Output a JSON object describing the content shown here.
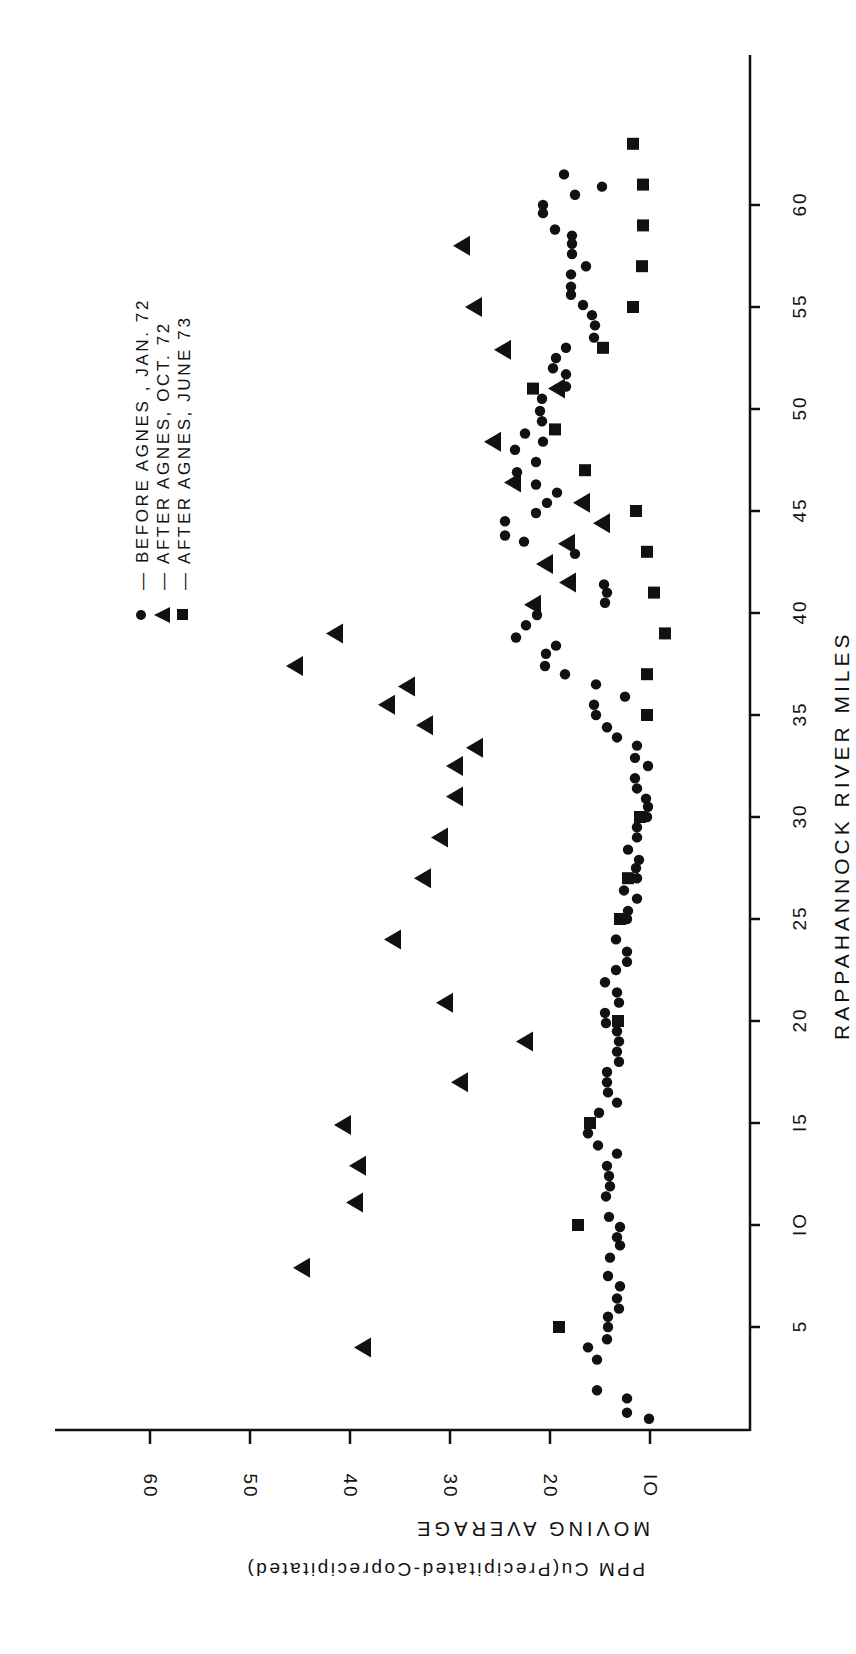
{
  "chart_data": {
    "type": "scatter",
    "orientation_note_visible": "figure rotated 90 degrees counter-clockwise",
    "title": "",
    "xlabel": "RAPPAHANNOCK RIVER MILES",
    "ylabel_line1": "PPM  Cu(Precipitated-Coprecipitated)",
    "ylabel_line2": "MOVING  AVERAGE",
    "xlim": [
      0,
      66
    ],
    "ylim": [
      0,
      70
    ],
    "xticks": [
      5,
      10,
      15,
      20,
      25,
      30,
      35,
      40,
      45,
      50,
      55,
      60
    ],
    "yticks": [
      10,
      20,
      30,
      40,
      50,
      60
    ],
    "grid": false,
    "legend_position": "upper-left of plot (rotated)",
    "series": [
      {
        "name": "BEFORE AGNES, JAN. 72",
        "legend_text": "— BEFORE  AGNES , JAN. 72",
        "marker": "circle",
        "points": [
          [
            0.5,
            10.1
          ],
          [
            0.8,
            12.3
          ],
          [
            1.5,
            12.3
          ],
          [
            1.9,
            15.3
          ],
          [
            3.4,
            15.3
          ],
          [
            4.0,
            16.2
          ],
          [
            4.4,
            14.3
          ],
          [
            5.0,
            14.2
          ],
          [
            5.5,
            14.2
          ],
          [
            5.9,
            13.1
          ],
          [
            6.4,
            13.3
          ],
          [
            7.0,
            13.0
          ],
          [
            7.5,
            14.2
          ],
          [
            8.4,
            14.0
          ],
          [
            9.0,
            13.0
          ],
          [
            9.4,
            13.3
          ],
          [
            9.9,
            13.0
          ],
          [
            10.4,
            14.1
          ],
          [
            11.4,
            14.4
          ],
          [
            11.9,
            14.0
          ],
          [
            12.4,
            14.1
          ],
          [
            12.9,
            14.3
          ],
          [
            13.5,
            13.3
          ],
          [
            13.9,
            15.2
          ],
          [
            14.5,
            16.2
          ],
          [
            15.5,
            15.1
          ],
          [
            16.0,
            13.3
          ],
          [
            16.5,
            14.2
          ],
          [
            17.0,
            14.3
          ],
          [
            17.5,
            14.3
          ],
          [
            18.0,
            13.1
          ],
          [
            18.5,
            13.3
          ],
          [
            19.0,
            13.1
          ],
          [
            19.5,
            13.3
          ],
          [
            19.9,
            14.4
          ],
          [
            20.4,
            14.5
          ],
          [
            20.9,
            13.1
          ],
          [
            21.4,
            13.3
          ],
          [
            21.9,
            14.5
          ],
          [
            22.5,
            13.4
          ],
          [
            22.9,
            12.3
          ],
          [
            23.4,
            12.3
          ],
          [
            24.0,
            13.4
          ],
          [
            25.0,
            12.3
          ],
          [
            25.4,
            12.2
          ],
          [
            26.0,
            11.3
          ],
          [
            26.4,
            12.6
          ],
          [
            27.0,
            11.3
          ],
          [
            27.5,
            11.4
          ],
          [
            27.9,
            11.1
          ],
          [
            28.4,
            12.2
          ],
          [
            29.0,
            11.3
          ],
          [
            29.5,
            11.3
          ],
          [
            30.0,
            10.3
          ],
          [
            30.5,
            10.2
          ],
          [
            30.9,
            10.4
          ],
          [
            31.4,
            11.3
          ],
          [
            31.9,
            11.5
          ],
          [
            32.5,
            10.2
          ],
          [
            32.9,
            11.5
          ],
          [
            33.5,
            11.3
          ],
          [
            33.9,
            13.3
          ],
          [
            34.4,
            14.3
          ],
          [
            35.0,
            15.4
          ],
          [
            35.5,
            15.6
          ],
          [
            35.9,
            12.5
          ],
          [
            36.5,
            15.4
          ],
          [
            37.0,
            18.5
          ],
          [
            37.4,
            20.5
          ],
          [
            38.0,
            20.4
          ],
          [
            38.4,
            19.4
          ],
          [
            38.8,
            23.4
          ],
          [
            39.4,
            22.4
          ],
          [
            39.9,
            21.3
          ],
          [
            40.5,
            14.5
          ],
          [
            41.0,
            14.3
          ],
          [
            41.4,
            14.6
          ],
          [
            42.9,
            17.5
          ],
          [
            43.5,
            22.6
          ],
          [
            43.8,
            24.5
          ],
          [
            44.5,
            24.5
          ],
          [
            44.9,
            21.4
          ],
          [
            45.4,
            20.3
          ],
          [
            45.9,
            19.3
          ],
          [
            46.3,
            21.4
          ],
          [
            46.9,
            23.3
          ],
          [
            47.4,
            21.4
          ],
          [
            48.0,
            23.5
          ],
          [
            48.4,
            20.7
          ],
          [
            48.8,
            22.5
          ],
          [
            49.4,
            20.8
          ],
          [
            49.9,
            21.0
          ],
          [
            50.5,
            20.8
          ],
          [
            51.1,
            18.4
          ],
          [
            51.7,
            18.4
          ],
          [
            52.0,
            19.7
          ],
          [
            52.5,
            19.4
          ],
          [
            53.0,
            18.4
          ],
          [
            53.5,
            15.6
          ],
          [
            54.1,
            15.5
          ],
          [
            54.6,
            15.8
          ],
          [
            55.1,
            16.7
          ],
          [
            55.6,
            17.9
          ],
          [
            56.0,
            17.9
          ],
          [
            56.6,
            17.9
          ],
          [
            57.0,
            16.4
          ],
          [
            57.6,
            17.8
          ],
          [
            58.1,
            17.8
          ],
          [
            58.5,
            17.8
          ],
          [
            58.8,
            19.5
          ],
          [
            59.6,
            20.7
          ],
          [
            60.0,
            20.7
          ],
          [
            60.5,
            17.5
          ],
          [
            60.9,
            14.8
          ],
          [
            61.5,
            18.6
          ]
        ]
      },
      {
        "name": "AFTER AGNES, OCT. 72",
        "legend_text": "— AFTER  AGNES, OCT. 72",
        "marker": "triangle",
        "points": [
          [
            4.0,
            38.7
          ],
          [
            7.9,
            44.8
          ],
          [
            11.1,
            39.5
          ],
          [
            12.9,
            39.2
          ],
          [
            14.9,
            40.7
          ],
          [
            17.0,
            29.0
          ],
          [
            19.0,
            22.5
          ],
          [
            20.9,
            30.5
          ],
          [
            24.0,
            35.7
          ],
          [
            27.0,
            32.7
          ],
          [
            29.0,
            31.0
          ],
          [
            31.0,
            29.5
          ],
          [
            32.5,
            29.5
          ],
          [
            33.4,
            27.5
          ],
          [
            34.5,
            32.5
          ],
          [
            35.5,
            36.3
          ],
          [
            36.4,
            34.3
          ],
          [
            37.4,
            45.5
          ],
          [
            39.0,
            41.5
          ],
          [
            40.4,
            21.7
          ],
          [
            41.5,
            18.2
          ],
          [
            42.4,
            20.5
          ],
          [
            43.4,
            18.3
          ],
          [
            44.4,
            14.8
          ],
          [
            45.4,
            16.8
          ],
          [
            46.4,
            23.7
          ],
          [
            48.4,
            25.7
          ],
          [
            51.0,
            19.3
          ],
          [
            52.9,
            24.7
          ],
          [
            55.0,
            27.6
          ],
          [
            58.0,
            28.8
          ]
        ]
      },
      {
        "name": "AFTER AGNES, JUNE 73",
        "legend_text": "— AFTER  AGNES, JUNE 73",
        "marker": "square",
        "points": [
          [
            5.0,
            19.1
          ],
          [
            10.0,
            17.2
          ],
          [
            15.0,
            16.0
          ],
          [
            20.0,
            13.2
          ],
          [
            25.0,
            13.0
          ],
          [
            27.0,
            12.2
          ],
          [
            30.0,
            11.0
          ],
          [
            35.0,
            10.3
          ],
          [
            37.0,
            10.3
          ],
          [
            39.0,
            8.5
          ],
          [
            41.0,
            9.6
          ],
          [
            43.0,
            10.3
          ],
          [
            45.0,
            11.4
          ],
          [
            47.0,
            16.5
          ],
          [
            49.0,
            19.5
          ],
          [
            51.0,
            21.7
          ],
          [
            53.0,
            14.7
          ],
          [
            55.0,
            11.7
          ],
          [
            57.0,
            10.8
          ],
          [
            59.0,
            10.7
          ],
          [
            61.0,
            10.7
          ],
          [
            63.0,
            11.7
          ]
        ]
      }
    ]
  },
  "labels": {
    "xlabel": "RAPPAHANNOCK RIVER MILES",
    "ylabel_line1": "PPM  Cu(Precipitated-Coprecipitated)",
    "ylabel_line2": "MOVING  AVERAGE",
    "legend": [
      "— BEFORE  AGNES , JAN. 72",
      "— AFTER  AGNES, OCT. 72",
      "— AFTER  AGNES, JUNE 73"
    ],
    "xticks": [
      "5",
      "IO",
      "I5",
      "20",
      "25",
      "30",
      "35",
      "40",
      "45",
      "50",
      "55",
      "60"
    ],
    "yticks": [
      "60",
      "50",
      "40",
      "30",
      "20",
      "IO"
    ]
  },
  "style": {
    "ink": "#111111",
    "background": "#ffffff"
  }
}
